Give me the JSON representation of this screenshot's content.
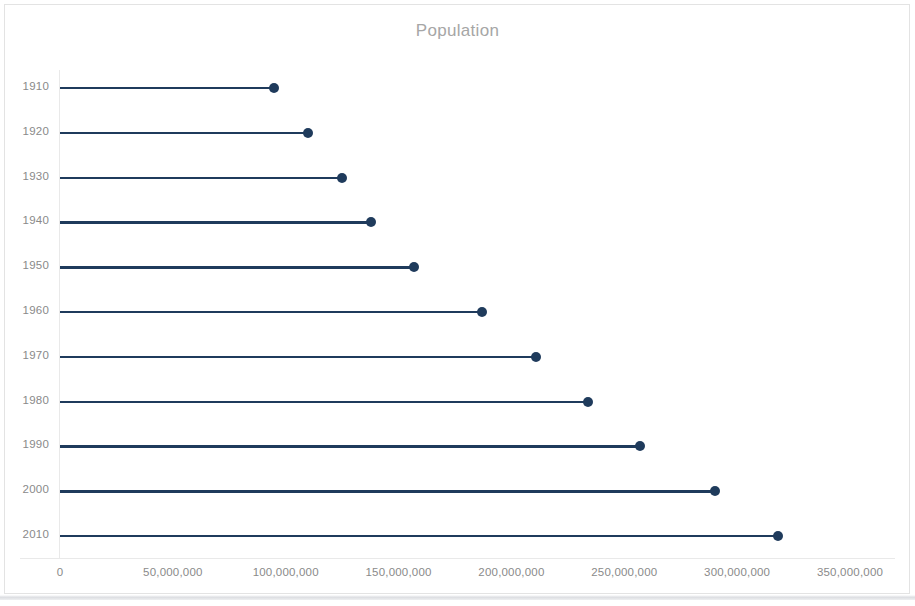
{
  "chart_data": {
    "type": "bar",
    "subtype": "lollipop-horizontal",
    "title": "Population",
    "xlabel": "",
    "ylabel": "",
    "categories": [
      "1910",
      "1920",
      "1930",
      "1940",
      "1950",
      "1960",
      "1970",
      "1980",
      "1990",
      "2000",
      "2010"
    ],
    "values": [
      95000000,
      110000000,
      125000000,
      138000000,
      157000000,
      187000000,
      211000000,
      234000000,
      257000000,
      290000000,
      318000000
    ],
    "xlim": [
      0,
      350000000
    ],
    "x_tick_values": [
      0,
      50000000,
      100000000,
      150000000,
      200000000,
      250000000,
      300000000,
      350000000
    ],
    "x_tick_labels": [
      "0",
      "50,000,000",
      "100,000,000",
      "150,000,000",
      "200,000,000",
      "250,000,000",
      "300,000,000",
      "350,000,000"
    ],
    "y_tick_labels": [
      "1910",
      "1920",
      "1930",
      "1940",
      "1950",
      "1960",
      "1970",
      "1980",
      "1990",
      "2000",
      "2010"
    ],
    "grid": false,
    "legend": null,
    "series": [
      {
        "name": "Population",
        "values": [
          95000000,
          110000000,
          125000000,
          138000000,
          157000000,
          187000000,
          211000000,
          234000000,
          257000000,
          290000000,
          318000000
        ]
      }
    ],
    "colors": {
      "marker": "#1f3b5c",
      "line": "#1f3b5c",
      "title_text": "#a6a6a6",
      "tick_text": "#8a8a8a",
      "axis_line": "#e9e9e9",
      "plot_background": "#ffffff",
      "border": "#e3e3e3"
    }
  }
}
